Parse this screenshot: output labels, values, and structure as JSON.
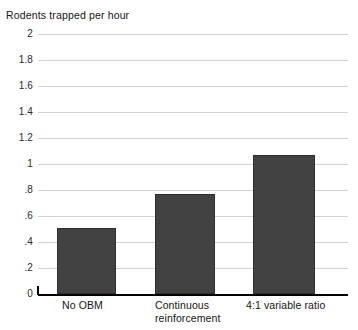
{
  "chart_data": {
    "type": "bar",
    "title": "Rodents trapped per hour",
    "xlabel": "",
    "ylabel": "",
    "categories": [
      "No OBM",
      "Continuous reinforcement",
      "4:1 variable ratio"
    ],
    "values": [
      0.51,
      0.77,
      1.07
    ],
    "ylim": [
      0,
      2
    ],
    "ytick_values": [
      0,
      0.2,
      0.4,
      0.6,
      0.8,
      1,
      1.2,
      1.4,
      1.6,
      1.8,
      2
    ],
    "ytick_labels": [
      "0",
      ".2",
      ".4",
      ".6",
      ".8",
      "1",
      "1.2",
      "1.4",
      "1.6",
      "1.8",
      "2"
    ],
    "grid": true,
    "legend": false,
    "series": [
      {
        "name": "Rodents trapped per hour",
        "values": [
          0.51,
          0.77,
          1.07
        ],
        "color": "#424242"
      }
    ],
    "category_label_lines": [
      [
        "No OBM"
      ],
      [
        "Continuous",
        "reinforcement"
      ],
      [
        "4:1 variable ratio"
      ]
    ]
  },
  "chart": {
    "title": "Rodents trapped per hour",
    "bar_color": "#424242",
    "gridline_color": "#d2d2d2",
    "axis_color": "#000000",
    "background": "#ffffff",
    "categories": [
      {
        "label_line1": "No OBM",
        "label_line2": "",
        "value": 0.51
      },
      {
        "label_line1": "Continuous",
        "label_line2": "reinforcement",
        "value": 0.77
      },
      {
        "label_line1": "4:1 variable ratio",
        "label_line2": "",
        "value": 1.07
      }
    ],
    "yticks": [
      {
        "label": "2",
        "value": 2
      },
      {
        "label": "1.8",
        "value": 1.8
      },
      {
        "label": "1.6",
        "value": 1.6
      },
      {
        "label": "1.4",
        "value": 1.4
      },
      {
        "label": "1.2",
        "value": 1.2
      },
      {
        "label": "1",
        "value": 1
      },
      {
        "label": ".8",
        "value": 0.8
      },
      {
        "label": ".6",
        "value": 0.6
      },
      {
        "label": ".4",
        "value": 0.4
      },
      {
        "label": ".2",
        "value": 0.2
      },
      {
        "label": "0",
        "value": 0
      }
    ]
  }
}
